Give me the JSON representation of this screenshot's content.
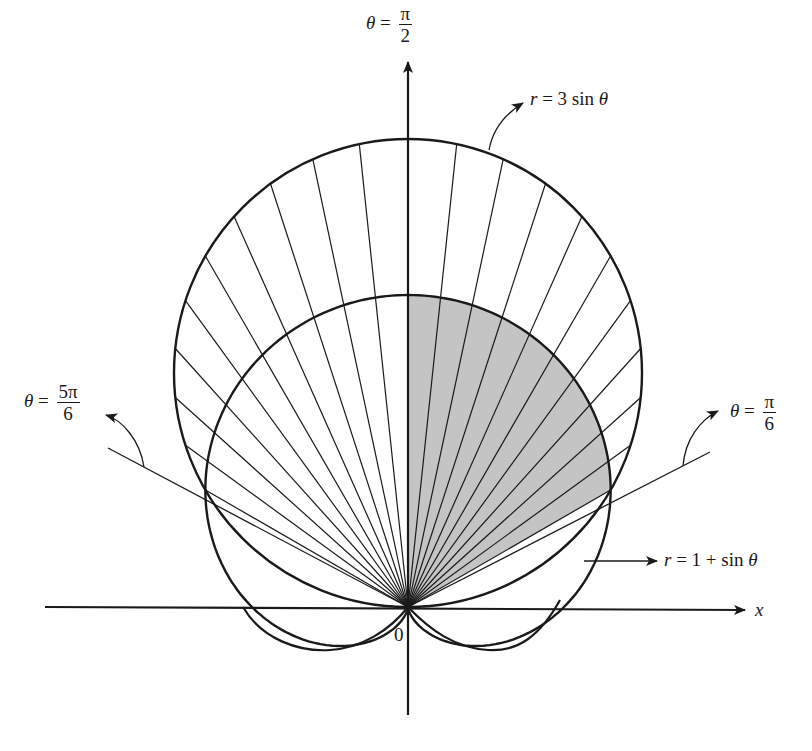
{
  "diagram": {
    "type": "polar-area-diagram",
    "origin_px": [
      408,
      607
    ],
    "scale_px_per_unit": 156,
    "colors": {
      "ink": "#1a1a1a",
      "shade": "#c4c4c4",
      "background": "#ffffff"
    },
    "curves": [
      {
        "name": "outer-circle",
        "equation": "r = 3 sin θ"
      },
      {
        "name": "cardioid",
        "equation": "r = 1 + sin θ"
      }
    ],
    "shaded_region": "inside r = 1 + sin θ and outside r = 3 sin θ boundary, π/6 ≤ θ ≤ π/2",
    "ray_angles_deg": [
      30,
      36,
      42,
      48,
      54,
      60,
      66,
      72,
      78,
      84,
      96,
      102,
      108,
      114,
      120,
      126,
      132,
      138,
      144,
      150
    ]
  },
  "labels": {
    "theta_pi_over_2": {
      "lhs": "θ",
      "eq": "=",
      "num": "π",
      "den": "2"
    },
    "theta_5pi_over_6": {
      "lhs": "θ",
      "eq": "=",
      "num": "5π",
      "den": "6"
    },
    "theta_pi_over_6": {
      "lhs": "θ",
      "eq": "=",
      "num": "π",
      "den": "6"
    },
    "outer_curve": {
      "var": "r",
      "rest": " = 3 sin ",
      "theta": "θ"
    },
    "inner_curve": {
      "var": "r",
      "rest": " = 1 + sin ",
      "theta": "θ"
    },
    "x_axis": "x",
    "origin": "0"
  }
}
